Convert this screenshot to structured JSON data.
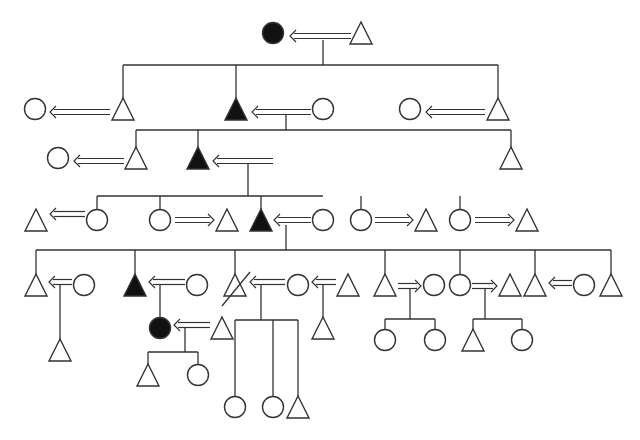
{
  "diagram": {
    "type": "pedigree",
    "colors": {
      "stroke": "#333333",
      "affected_fill": "#111111",
      "unaffected_fill": "#ffffff",
      "background": "#ffffff"
    },
    "legend": {
      "triangle": "male",
      "circle": "female",
      "filled": "affected",
      "double-arrow": "marriage / spouse link"
    },
    "nodes": [
      {
        "id": "g1_f",
        "shape": "circle",
        "x": 273,
        "y": 33,
        "filled": true
      },
      {
        "id": "g1_m",
        "shape": "triangle",
        "x": 361,
        "y": 33,
        "filled": false
      },
      {
        "id": "g2_w1",
        "shape": "circle",
        "x": 35,
        "y": 109,
        "filled": false
      },
      {
        "id": "g2_s1",
        "shape": "triangle",
        "x": 123,
        "y": 109,
        "filled": false
      },
      {
        "id": "g2_s2",
        "shape": "triangle",
        "x": 236,
        "y": 109,
        "filled": true
      },
      {
        "id": "g2_w2",
        "shape": "circle",
        "x": 323,
        "y": 109,
        "filled": false
      },
      {
        "id": "g2_w3",
        "shape": "circle",
        "x": 410,
        "y": 109,
        "filled": false
      },
      {
        "id": "g2_s3",
        "shape": "triangle",
        "x": 498,
        "y": 109,
        "filled": false
      },
      {
        "id": "g3_w1",
        "shape": "circle",
        "x": 58,
        "y": 158,
        "filled": false
      },
      {
        "id": "g3_s1",
        "shape": "triangle",
        "x": 136,
        "y": 158,
        "filled": false
      },
      {
        "id": "g3_s2",
        "shape": "triangle",
        "x": 198,
        "y": 158,
        "filled": true
      },
      {
        "id": "g3_s3",
        "shape": "triangle",
        "x": 511,
        "y": 158,
        "filled": false
      },
      {
        "id": "g4_h1",
        "shape": "triangle",
        "x": 36,
        "y": 220,
        "filled": false
      },
      {
        "id": "g4_d1",
        "shape": "circle",
        "x": 97,
        "y": 220,
        "filled": false
      },
      {
        "id": "g4_d2",
        "shape": "circle",
        "x": 160,
        "y": 220,
        "filled": false
      },
      {
        "id": "g4_h2",
        "shape": "triangle",
        "x": 227,
        "y": 220,
        "filled": false
      },
      {
        "id": "g4_s3",
        "shape": "triangle",
        "x": 261,
        "y": 220,
        "filled": true
      },
      {
        "id": "g4_w3",
        "shape": "circle",
        "x": 323,
        "y": 220,
        "filled": false
      },
      {
        "id": "g4_d4",
        "shape": "circle",
        "x": 361,
        "y": 220,
        "filled": false
      },
      {
        "id": "g4_h4",
        "shape": "triangle",
        "x": 426,
        "y": 220,
        "filled": false
      },
      {
        "id": "g4_d5",
        "shape": "circle",
        "x": 460,
        "y": 220,
        "filled": false
      },
      {
        "id": "g4_h5",
        "shape": "triangle",
        "x": 527,
        "y": 220,
        "filled": false
      },
      {
        "id": "g5_s1",
        "shape": "triangle",
        "x": 36,
        "y": 285,
        "filled": false
      },
      {
        "id": "g5_w1",
        "shape": "circle",
        "x": 84,
        "y": 285,
        "filled": false
      },
      {
        "id": "g5_s2",
        "shape": "triangle",
        "x": 135,
        "y": 285,
        "filled": true
      },
      {
        "id": "g5_w2",
        "shape": "circle",
        "x": 197,
        "y": 285,
        "filled": false
      },
      {
        "id": "g5_s3",
        "shape": "triangle",
        "x": 235,
        "y": 285,
        "filled": false,
        "deceased": true
      },
      {
        "id": "g5_w3",
        "shape": "circle",
        "x": 298,
        "y": 285,
        "filled": false
      },
      {
        "id": "g5_h3",
        "shape": "triangle",
        "x": 348,
        "y": 285,
        "filled": false
      },
      {
        "id": "g5_s4",
        "shape": "triangle",
        "x": 385,
        "y": 285,
        "filled": false
      },
      {
        "id": "g5_w4",
        "shape": "circle",
        "x": 434,
        "y": 285,
        "filled": false
      },
      {
        "id": "g5_d5",
        "shape": "circle",
        "x": 460,
        "y": 285,
        "filled": false
      },
      {
        "id": "g5_h5",
        "shape": "triangle",
        "x": 510,
        "y": 285,
        "filled": false
      },
      {
        "id": "g5_s6",
        "shape": "triangle",
        "x": 535,
        "y": 285,
        "filled": false
      },
      {
        "id": "g5_w6",
        "shape": "circle",
        "x": 584,
        "y": 285,
        "filled": false
      },
      {
        "id": "g5_s7",
        "shape": "triangle",
        "x": 611,
        "y": 285,
        "filled": false
      },
      {
        "id": "g6_c1",
        "shape": "triangle",
        "x": 60,
        "y": 350,
        "filled": false
      },
      {
        "id": "g6_d2",
        "shape": "circle",
        "x": 160,
        "y": 328,
        "filled": true
      },
      {
        "id": "g6_h2",
        "shape": "triangle",
        "x": 222,
        "y": 328,
        "filled": false
      },
      {
        "id": "g6_c3",
        "shape": "triangle",
        "x": 323,
        "y": 328,
        "filled": false
      },
      {
        "id": "g6_c4a",
        "shape": "circle",
        "x": 385,
        "y": 340,
        "filled": false
      },
      {
        "id": "g6_c4b",
        "shape": "circle",
        "x": 435,
        "y": 340,
        "filled": false
      },
      {
        "id": "g6_c5a",
        "shape": "triangle",
        "x": 473,
        "y": 340,
        "filled": false
      },
      {
        "id": "g6_c5b",
        "shape": "circle",
        "x": 522,
        "y": 340,
        "filled": false
      },
      {
        "id": "g7_c1",
        "shape": "triangle",
        "x": 148,
        "y": 375,
        "filled": false
      },
      {
        "id": "g7_c2",
        "shape": "circle",
        "x": 198,
        "y": 375,
        "filled": false
      },
      {
        "id": "g7_c3",
        "shape": "circle",
        "x": 235,
        "y": 407,
        "filled": false
      },
      {
        "id": "g7_c4",
        "shape": "circle",
        "x": 273,
        "y": 407,
        "filled": false
      },
      {
        "id": "g7_c5",
        "shape": "triangle",
        "x": 298,
        "y": 407,
        "filled": false
      }
    ],
    "marriages": [
      {
        "x1": 351,
        "x2": 290,
        "y": 36,
        "dir": "left"
      },
      {
        "x1": 110,
        "x2": 50,
        "y": 112,
        "dir": "left"
      },
      {
        "x1": 311,
        "x2": 252,
        "y": 112,
        "dir": "left"
      },
      {
        "x1": 485,
        "x2": 426,
        "y": 112,
        "dir": "left"
      },
      {
        "x1": 124,
        "x2": 74,
        "y": 161,
        "dir": "left"
      },
      {
        "x1": 273,
        "x2": 213,
        "y": 161,
        "dir": "left"
      },
      {
        "x1": 85,
        "x2": 50,
        "y": 214,
        "dir": "left"
      },
      {
        "x1": 175,
        "x2": 214,
        "y": 220,
        "dir": "right"
      },
      {
        "x1": 311,
        "x2": 274,
        "y": 220,
        "dir": "left"
      },
      {
        "x1": 375,
        "x2": 413,
        "y": 220,
        "dir": "right"
      },
      {
        "x1": 475,
        "x2": 514,
        "y": 220,
        "dir": "right"
      },
      {
        "x1": 72,
        "x2": 49,
        "y": 282,
        "dir": "left"
      },
      {
        "x1": 185,
        "x2": 149,
        "y": 282,
        "dir": "left"
      },
      {
        "x1": 285,
        "x2": 250,
        "y": 282,
        "dir": "left"
      },
      {
        "x1": 336,
        "x2": 312,
        "y": 282,
        "dir": "left"
      },
      {
        "x1": 398,
        "x2": 421,
        "y": 286,
        "dir": "right"
      },
      {
        "x1": 472,
        "x2": 497,
        "y": 286,
        "dir": "right"
      },
      {
        "x1": 572,
        "x2": 549,
        "y": 283,
        "dir": "left"
      },
      {
        "x1": 210,
        "x2": 174,
        "y": 325,
        "dir": "left"
      }
    ],
    "lines": [
      [
        323,
        40,
        323,
        65
      ],
      [
        123,
        65,
        498,
        65
      ],
      [
        123,
        65,
        123,
        98
      ],
      [
        236,
        65,
        236,
        98
      ],
      [
        498,
        65,
        498,
        98
      ],
      [
        286,
        115,
        286,
        130
      ],
      [
        136,
        130,
        511,
        130
      ],
      [
        136,
        130,
        136,
        147
      ],
      [
        198,
        130,
        198,
        147
      ],
      [
        511,
        130,
        511,
        147
      ],
      [
        248,
        164,
        248,
        196
      ],
      [
        97,
        196,
        323,
        196
      ],
      [
        97,
        196,
        97,
        209
      ],
      [
        160,
        196,
        160,
        209
      ],
      [
        261,
        196,
        261,
        209
      ],
      [
        361,
        196,
        361,
        209
      ],
      [
        460,
        196,
        460,
        209
      ],
      [
        286,
        225,
        286,
        250
      ],
      [
        36,
        250,
        611,
        250
      ],
      [
        36,
        250,
        36,
        274
      ],
      [
        135,
        250,
        135,
        274
      ],
      [
        235,
        250,
        235,
        274
      ],
      [
        385,
        250,
        385,
        274
      ],
      [
        460,
        250,
        460,
        274
      ],
      [
        535,
        250,
        535,
        274
      ],
      [
        611,
        250,
        611,
        274
      ],
      [
        60,
        285,
        60,
        339
      ],
      [
        160,
        285,
        160,
        317
      ],
      [
        261,
        285,
        261,
        320
      ],
      [
        235,
        320,
        298,
        320
      ],
      [
        235,
        320,
        235,
        396
      ],
      [
        273,
        320,
        273,
        396
      ],
      [
        298,
        320,
        298,
        396
      ],
      [
        323,
        285,
        323,
        317
      ],
      [
        410,
        289,
        410,
        319
      ],
      [
        385,
        319,
        435,
        319
      ],
      [
        385,
        319,
        385,
        329
      ],
      [
        435,
        319,
        435,
        329
      ],
      [
        485,
        289,
        485,
        319
      ],
      [
        473,
        319,
        522,
        319
      ],
      [
        473,
        319,
        473,
        329
      ],
      [
        522,
        319,
        522,
        329
      ],
      [
        185,
        328,
        185,
        352
      ],
      [
        148,
        352,
        198,
        352
      ],
      [
        148,
        352,
        148,
        364
      ],
      [
        198,
        352,
        198,
        364
      ]
    ],
    "deceased_marks": [
      {
        "x1": 222,
        "y1": 306,
        "x2": 250,
        "y2": 272
      }
    ],
    "generation_count": 7
  }
}
